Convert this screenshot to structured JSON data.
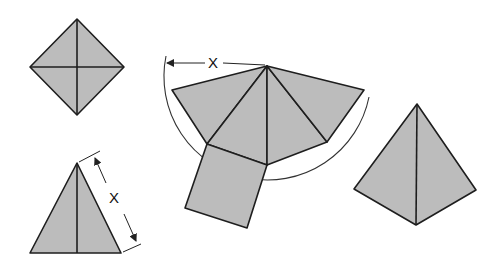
{
  "diagram": {
    "type": "geometry-net",
    "colors": {
      "face_fill": "#bcbcbc",
      "edge": "#1e1e1e",
      "background": "#ffffff"
    },
    "top_view": {
      "label": "top view (square with diagonals)"
    },
    "side_view": {
      "dimension_label": "X"
    },
    "net": {
      "dimension_label": "X",
      "faces": 4,
      "base": "square"
    },
    "pyramid_3d": {
      "label": "assembled pyramid"
    }
  }
}
